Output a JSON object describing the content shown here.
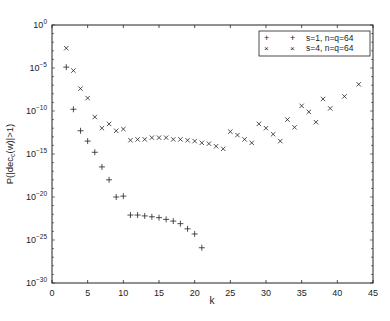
{
  "chart_data": {
    "type": "scatter",
    "title": "",
    "xlabel": "k",
    "ylabel": "P(|dec_c(w)|>1)",
    "xlim": [
      0,
      45
    ],
    "ylim_log10": [
      -30,
      0
    ],
    "yscale": "log",
    "grid": false,
    "legend_position": "upper right",
    "x_ticks": [
      0,
      5,
      10,
      15,
      20,
      25,
      30,
      35,
      40,
      45
    ],
    "y_ticks_log10": [
      0,
      -5,
      -10,
      -15,
      -20,
      -25,
      -30
    ],
    "y_tick_labels": [
      "10^0",
      "10^-5",
      "10^-10",
      "10^-15",
      "10^-20",
      "10^-25",
      "10^-30"
    ],
    "series": [
      {
        "name": "s=1, n=q=64",
        "marker": "+",
        "x": [
          2,
          3,
          4,
          5,
          6,
          7,
          8,
          9,
          10,
          11,
          12,
          13,
          14,
          15,
          16,
          17,
          18,
          19,
          20,
          21
        ],
        "log10_y": [
          -4.9,
          -9.8,
          -12.3,
          -13.5,
          -14.8,
          -16.5,
          -18.0,
          -20.0,
          -19.9,
          -22.1,
          -22.1,
          -22.2,
          -22.3,
          -22.4,
          -22.6,
          -22.8,
          -23.1,
          -23.7,
          -24.3,
          -25.9
        ]
      },
      {
        "name": "s=4, n=q=64",
        "marker": "x",
        "x": [
          2,
          3,
          4,
          5,
          6,
          7,
          8,
          9,
          10,
          11,
          12,
          13,
          14,
          15,
          16,
          17,
          18,
          19,
          20,
          21,
          22,
          23,
          24,
          25,
          26,
          27,
          28,
          29,
          30,
          31,
          32,
          33,
          34,
          35,
          36,
          37,
          38,
          39,
          41,
          43
        ],
        "log10_y": [
          -2.7,
          -5.3,
          -7.4,
          -8.5,
          -10.7,
          -12.0,
          -11.5,
          -12.3,
          -12.1,
          -13.4,
          -13.3,
          -13.3,
          -13.1,
          -13.1,
          -13.1,
          -13.3,
          -13.3,
          -13.4,
          -13.5,
          -13.7,
          -13.8,
          -14.1,
          -14.4,
          -12.4,
          -12.8,
          -13.3,
          -13.7,
          -11.5,
          -12.0,
          -12.7,
          -13.5,
          -11.0,
          -11.9,
          -9.4,
          -10.1,
          -11.3,
          -8.6,
          -9.7,
          -8.3,
          -6.9
        ]
      }
    ]
  },
  "legend": {
    "entries": [
      {
        "marker": "+",
        "label": "s=1, n=q=64"
      },
      {
        "marker": "×",
        "label": "s=4, n=q=64"
      }
    ]
  },
  "axes": {
    "xlabel": "k",
    "ylabel_main": "P(|dec",
    "ylabel_sub": "c",
    "ylabel_end": "(w)|>1)"
  }
}
